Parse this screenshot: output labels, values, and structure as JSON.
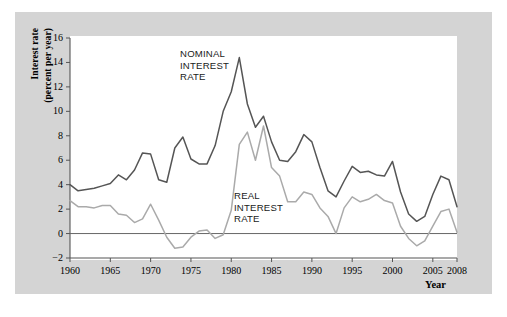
{
  "chart_data": {
    "type": "line",
    "title": "",
    "xlabel": "Year",
    "ylabel_line1": "Interest rate",
    "ylabel_line2": "(percent per year)",
    "xlim": [
      1960,
      2008
    ],
    "ylim": [
      -2,
      16
    ],
    "ytick_values": [
      -2,
      0,
      2,
      4,
      6,
      8,
      10,
      12,
      14,
      16
    ],
    "ytick_labels": [
      "−2",
      "0",
      "2",
      "4",
      "6",
      "8",
      "10",
      "12",
      "14",
      "16"
    ],
    "xtick_values": [
      1960,
      1965,
      1970,
      1975,
      1980,
      1985,
      1990,
      1995,
      2000,
      2005,
      2008
    ],
    "xtick_labels": [
      "1960",
      "1965",
      "1970",
      "1975",
      "1980",
      "1985",
      "1990",
      "1995",
      "2000",
      "2005",
      "2008"
    ],
    "grid": false,
    "legend_position": "inline-annotation",
    "zero_line": 0,
    "colors": {
      "nominal": "#555555",
      "real": "#aaaaaa",
      "panel": "#d4d4d4",
      "canvas": "#ffffff",
      "axis": "#555555",
      "text": "#000000"
    },
    "x": [
      1960,
      1961,
      1962,
      1963,
      1964,
      1965,
      1966,
      1967,
      1968,
      1969,
      1970,
      1971,
      1972,
      1973,
      1974,
      1975,
      1976,
      1977,
      1978,
      1979,
      1980,
      1981,
      1982,
      1983,
      1984,
      1985,
      1986,
      1987,
      1988,
      1989,
      1990,
      1991,
      1992,
      1993,
      1994,
      1995,
      1996,
      1997,
      1998,
      1999,
      2000,
      2001,
      2002,
      2003,
      2004,
      2005,
      2006,
      2007,
      2008
    ],
    "series": [
      {
        "name": "NOMINAL INTEREST RATE",
        "label_lines": [
          "NOMINAL",
          "INTEREST",
          "RATE"
        ],
        "color": "#555555",
        "values": [
          4.0,
          3.5,
          3.6,
          3.7,
          3.9,
          4.1,
          4.8,
          4.4,
          5.2,
          6.6,
          6.5,
          4.4,
          4.2,
          7.0,
          7.9,
          6.1,
          5.7,
          5.7,
          7.2,
          10.0,
          11.6,
          14.4,
          10.6,
          8.7,
          9.6,
          7.5,
          6.0,
          5.9,
          6.7,
          8.1,
          7.5,
          5.4,
          3.5,
          3.0,
          4.3,
          5.5,
          5.0,
          5.1,
          4.8,
          4.7,
          5.9,
          3.4,
          1.6,
          1.0,
          1.4,
          3.2,
          4.7,
          4.4,
          2.2
        ]
      },
      {
        "name": "REAL INTEREST RATE",
        "label_lines": [
          "REAL",
          "INTEREST",
          "RATE"
        ],
        "color": "#aaaaaa",
        "values": [
          2.7,
          2.2,
          2.2,
          2.1,
          2.3,
          2.3,
          1.6,
          1.5,
          0.9,
          1.2,
          2.4,
          1.1,
          -0.3,
          -1.2,
          -1.1,
          -0.3,
          0.2,
          0.3,
          -0.4,
          -0.1,
          1.9,
          7.3,
          8.3,
          6.0,
          8.8,
          5.4,
          4.7,
          2.6,
          2.6,
          3.4,
          3.2,
          2.1,
          1.4,
          0.0,
          2.1,
          3.0,
          2.6,
          2.8,
          3.2,
          2.7,
          2.5,
          0.6,
          -0.4,
          -1.0,
          -0.6,
          0.6,
          1.8,
          2.0,
          0.1
        ]
      }
    ]
  }
}
